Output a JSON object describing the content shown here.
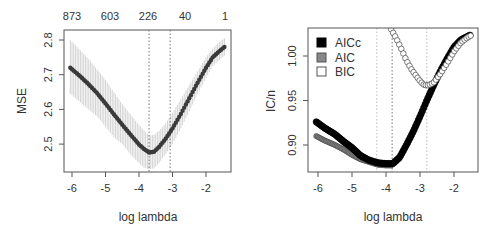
{
  "chart_data": [
    {
      "type": "line",
      "title": "",
      "xlabel": "log lambda",
      "ylabel": "MSE",
      "xlim": [
        -6.25,
        -1.25
      ],
      "ylim": [
        2.42,
        2.83
      ],
      "x_ticks": [
        -6,
        -5,
        -4,
        -3,
        -2
      ],
      "y_ticks": [
        2.5,
        2.6,
        2.7,
        2.8
      ],
      "top_axis": {
        "ticks_at_x": [
          -6,
          -4.85,
          -3.7,
          -2.6,
          -1.4
        ],
        "labels": [
          "873",
          "603",
          "226",
          "40",
          "1"
        ]
      },
      "vlines": [
        {
          "x": -3.7,
          "style": "dotted",
          "label": "lambda.min"
        },
        {
          "x": -3.07,
          "style": "dotted",
          "label": "lambda.1se"
        }
      ],
      "grid": false,
      "series": [
        {
          "name": "MSE",
          "x": [
            -6.05,
            -5.75,
            -5.5,
            -5.25,
            -5.0,
            -4.75,
            -4.5,
            -4.25,
            -4.0,
            -3.85,
            -3.7,
            -3.55,
            -3.4,
            -3.2,
            -3.0,
            -2.75,
            -2.5,
            -2.25,
            -2.0,
            -1.8,
            -1.6,
            -1.45
          ],
          "values": [
            2.72,
            2.695,
            2.672,
            2.647,
            2.617,
            2.586,
            2.556,
            2.527,
            2.499,
            2.486,
            2.476,
            2.478,
            2.492,
            2.516,
            2.545,
            2.587,
            2.632,
            2.677,
            2.72,
            2.75,
            2.768,
            2.78
          ],
          "error_band": {
            "upper": [
              2.8,
              2.77,
              2.745,
              2.715,
              2.685,
              2.65,
              2.615,
              2.585,
              2.555,
              2.54,
              2.525,
              2.527,
              2.538,
              2.56,
              2.59,
              2.63,
              2.67,
              2.71,
              2.75,
              2.775,
              2.795,
              2.805
            ],
            "lower": [
              2.645,
              2.62,
              2.6,
              2.58,
              2.55,
              2.52,
              2.5,
              2.47,
              2.445,
              2.432,
              2.427,
              2.43,
              2.446,
              2.472,
              2.5,
              2.545,
              2.594,
              2.645,
              2.69,
              2.725,
              2.742,
              2.755
            ]
          }
        }
      ]
    },
    {
      "type": "scatter",
      "title": "",
      "xlabel": "log lambda",
      "ylabel": "IC/n",
      "xlim": [
        -6.3,
        -1.3
      ],
      "ylim": [
        0.87,
        1.032
      ],
      "x_ticks": [
        -6,
        -5,
        -4,
        -3,
        -2
      ],
      "y_ticks": [
        0.9,
        0.95,
        1.0
      ],
      "vlines": [
        {
          "x": -4.27,
          "style": "dotted-light"
        },
        {
          "x": -3.82,
          "style": "dotted"
        },
        {
          "x": -2.8,
          "style": "dotted-light"
        }
      ],
      "legend": {
        "position": "topleft",
        "entries": [
          "AICc",
          "AIC",
          "BIC"
        ]
      },
      "grid": false,
      "series": [
        {
          "name": "AICc",
          "marker": "filled-black",
          "x": [
            -6.05,
            -5.8,
            -5.5,
            -5.25,
            -5.0,
            -4.75,
            -4.5,
            -4.25,
            -4.0,
            -3.8,
            -3.6,
            -3.4,
            -3.2,
            -3.0,
            -2.8,
            -2.6,
            -2.4,
            -2.2,
            -2.0,
            -1.8,
            -1.6,
            -1.5
          ],
          "values": [
            0.926,
            0.919,
            0.912,
            0.904,
            0.897,
            0.888,
            0.883,
            0.88,
            0.879,
            0.879,
            0.886,
            0.9,
            0.915,
            0.932,
            0.95,
            0.967,
            0.983,
            0.997,
            1.01,
            1.018,
            1.022,
            1.024
          ]
        },
        {
          "name": "AIC",
          "marker": "filled-grey",
          "x": [
            -6.05,
            -5.8,
            -5.5,
            -5.25,
            -5.0,
            -4.75,
            -4.5,
            -4.25,
            -4.0,
            -3.85
          ],
          "values": [
            0.91,
            0.905,
            0.9,
            0.895,
            0.889,
            0.884,
            0.881,
            0.878,
            0.877,
            0.877
          ]
        },
        {
          "name": "BIC",
          "marker": "open-circle",
          "x": [
            -3.85,
            -3.7,
            -3.55,
            -3.4,
            -3.25,
            -3.1,
            -3.0,
            -2.9,
            -2.8,
            -2.7,
            -2.6,
            -2.5,
            -2.4,
            -2.2,
            -2.0,
            -1.8,
            -1.6,
            -1.5
          ],
          "values": [
            1.03,
            1.02,
            1.008,
            0.995,
            0.985,
            0.977,
            0.972,
            0.968,
            0.967,
            0.968,
            0.97,
            0.975,
            0.98,
            0.992,
            1.005,
            1.015,
            1.021,
            1.023
          ]
        }
      ]
    }
  ],
  "labels": {
    "left": {
      "xlabel": "log lambda",
      "ylabel": "MSE",
      "top": [
        "873",
        "603",
        "226",
        "40",
        "1"
      ],
      "x_ticks": [
        "-6",
        "-5",
        "-4",
        "-3",
        "-2"
      ],
      "y_ticks": [
        "2.5",
        "2.6",
        "2.7",
        "2.8"
      ]
    },
    "right": {
      "xlabel": "log lambda",
      "ylabel": "IC/n",
      "x_ticks": [
        "-6",
        "-5",
        "-4",
        "-3",
        "-2"
      ],
      "y_ticks": [
        "0.90",
        "0.95",
        "1.00"
      ],
      "legend": [
        "AICc",
        "AIC",
        "BIC"
      ]
    }
  },
  "colors": {
    "line": "#3a3a3a",
    "band": "#c8c8c8",
    "aicc": "#000000",
    "aic": "#808080",
    "bic": "#ffffff",
    "axis": "#555555",
    "vline_dark": "#777777",
    "vline_light": "#bbbbbb"
  }
}
